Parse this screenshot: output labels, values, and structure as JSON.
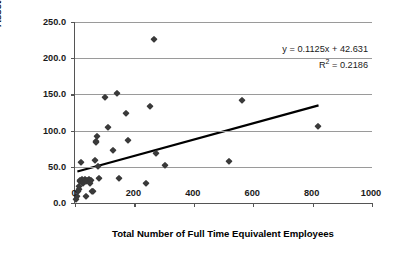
{
  "chart_data": {
    "type": "scatter",
    "title": "",
    "xlabel": "Total Number of Full Time Equivalent Employees",
    "ylabel": "Assets Under Management as at Dec 2010 (USD millions)",
    "xlim": [
      0,
      1000
    ],
    "ylim": [
      0,
      250
    ],
    "xticks": [
      "0",
      "200",
      "400",
      "600",
      "800",
      "1000"
    ],
    "xtick_values": [
      0,
      200,
      400,
      600,
      800,
      1000
    ],
    "yticks": [
      "0.0",
      "50.0",
      "100.0",
      "150.0",
      "200.0",
      "250.0"
    ],
    "ytick_values": [
      0,
      50,
      100,
      150,
      200,
      250
    ],
    "grid": "horizontal",
    "legend": "none",
    "marker": "diamond",
    "marker_color": "#3a3a3a",
    "trendline": {
      "equation": "y = 0.1125x + 42.631",
      "r_squared_label": "R",
      "r_squared_exponent": "2",
      "r_squared_value": " = 0.2186",
      "slope": 0.1125,
      "intercept": 42.631,
      "r2": 0.2186,
      "x_start": 8,
      "x_end": 820,
      "color": "#000000"
    },
    "points": [
      {
        "x": 5,
        "y": 5
      },
      {
        "x": 8,
        "y": 9
      },
      {
        "x": 10,
        "y": 17
      },
      {
        "x": 12,
        "y": 20
      },
      {
        "x": 14,
        "y": 24
      },
      {
        "x": 16,
        "y": 30
      },
      {
        "x": 18,
        "y": 32
      },
      {
        "x": 20,
        "y": 57
      },
      {
        "x": 22,
        "y": 33
      },
      {
        "x": 26,
        "y": 31
      },
      {
        "x": 28,
        "y": 27
      },
      {
        "x": 32,
        "y": 33
      },
      {
        "x": 36,
        "y": 10
      },
      {
        "x": 38,
        "y": 31
      },
      {
        "x": 42,
        "y": 32
      },
      {
        "x": 46,
        "y": 33
      },
      {
        "x": 50,
        "y": 28
      },
      {
        "x": 54,
        "y": 32
      },
      {
        "x": 58,
        "y": 16
      },
      {
        "x": 62,
        "y": 16
      },
      {
        "x": 66,
        "y": 59
      },
      {
        "x": 70,
        "y": 86
      },
      {
        "x": 72,
        "y": 84
      },
      {
        "x": 74,
        "y": 93
      },
      {
        "x": 78,
        "y": 51
      },
      {
        "x": 82,
        "y": 35
      },
      {
        "x": 100,
        "y": 146
      },
      {
        "x": 110,
        "y": 105
      },
      {
        "x": 128,
        "y": 73
      },
      {
        "x": 140,
        "y": 152
      },
      {
        "x": 148,
        "y": 34
      },
      {
        "x": 172,
        "y": 124
      },
      {
        "x": 178,
        "y": 87
      },
      {
        "x": 240,
        "y": 28
      },
      {
        "x": 252,
        "y": 134
      },
      {
        "x": 265,
        "y": 226
      },
      {
        "x": 272,
        "y": 69
      },
      {
        "x": 302,
        "y": 53
      },
      {
        "x": 520,
        "y": 58
      },
      {
        "x": 563,
        "y": 142
      },
      {
        "x": 818,
        "y": 107
      }
    ]
  }
}
